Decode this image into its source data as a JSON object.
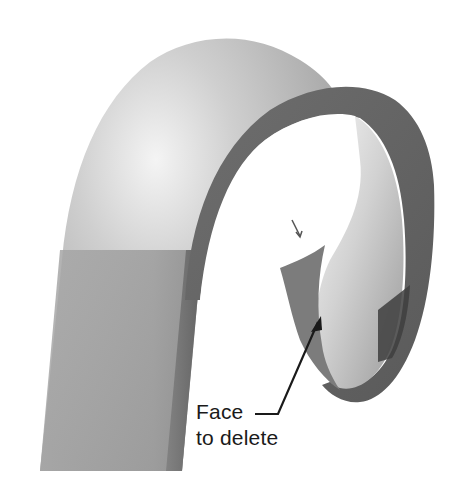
{
  "figure": {
    "callout": {
      "line1": "Face",
      "line2": "to delete"
    },
    "colors": {
      "background": "#ffffff",
      "surface_light": "#e6e6e6",
      "surface_mid": "#a9a9a9",
      "surface_dark": "#6f6f6f",
      "edge_band": "#6a6a6a",
      "arrow": "#1a1a1a",
      "text": "#1a1a1a"
    }
  }
}
